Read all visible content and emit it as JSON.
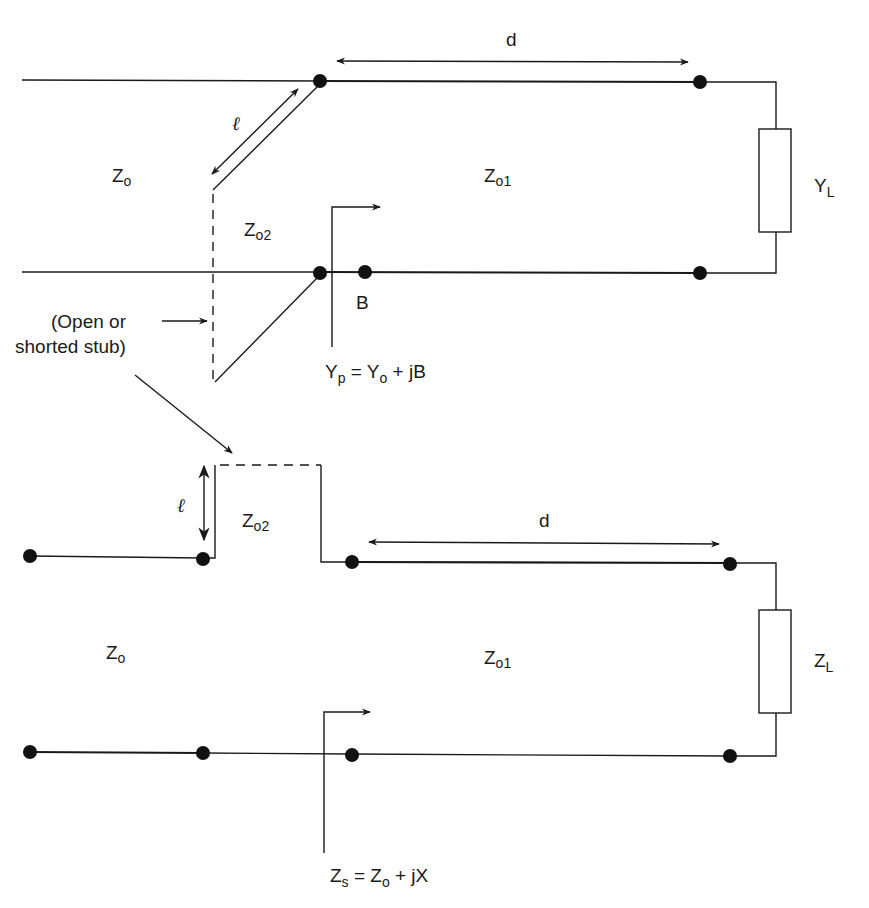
{
  "diagram": {
    "colors": {
      "ink": "#1a1a1a",
      "background": "#ffffff"
    },
    "top": {
      "label_d": "d",
      "label_ell": "ℓ",
      "label_z0": {
        "main": "Z",
        "sub": "o"
      },
      "label_z01": {
        "main": "Z",
        "sub": "o1"
      },
      "label_z02": {
        "main": "Z",
        "sub": "o2"
      },
      "label_load": {
        "main": "Y",
        "sub": "L"
      },
      "label_b": "B",
      "equation": {
        "lhs_main": "Y",
        "lhs_sub": "p",
        "eq": " = ",
        "rhs_main": "Y",
        "rhs_sub": "o",
        "rhs_tail": " + jB"
      }
    },
    "stub_note": {
      "line1": "(Open or",
      "line2": "shorted stub)"
    },
    "bottom": {
      "label_d": "d",
      "label_ell": "ℓ",
      "label_z0": {
        "main": "Z",
        "sub": "o"
      },
      "label_z01": {
        "main": "Z",
        "sub": "o1"
      },
      "label_z02": {
        "main": "Z",
        "sub": "o2"
      },
      "label_load": {
        "main": "Z",
        "sub": "L"
      },
      "equation": {
        "lhs_main": "Z",
        "lhs_sub": "s",
        "eq": " = ",
        "rhs_main": "Z",
        "rhs_sub": "o",
        "rhs_tail": " + jX"
      }
    }
  }
}
